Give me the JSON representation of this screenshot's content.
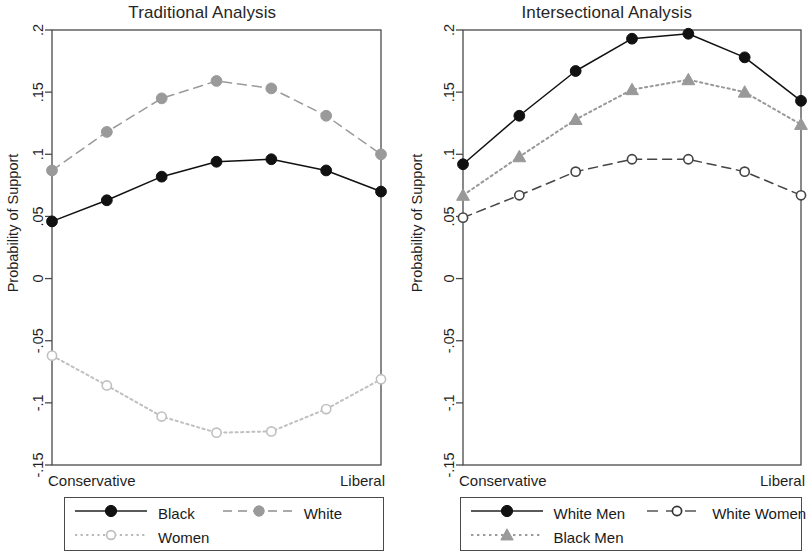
{
  "figure": {
    "background": "#ffffff",
    "axis_color": "#4a4a4a",
    "text_color": "#1f1f1f"
  },
  "panels": [
    {
      "id": "traditional",
      "title": "Traditional Analysis",
      "ylabel": "Probability of Support",
      "x_left_label": "Conservative",
      "x_right_label": "Liberal",
      "legend": [
        {
          "label": "Black",
          "key": "solid-filled-black-circle"
        },
        {
          "label": "White",
          "key": "dashed-filled-gray-circle"
        },
        {
          "label": "Women",
          "key": "dotted-open-lightgray-circle"
        }
      ]
    },
    {
      "id": "intersectional",
      "title": "Intersectional Analysis",
      "ylabel": "Probability of Support",
      "x_left_label": "Conservative",
      "x_right_label": "Liberal",
      "legend": [
        {
          "label": "White Men",
          "key": "solid-filled-black-circle"
        },
        {
          "label": "White Women",
          "key": "dashed-open-circle"
        },
        {
          "label": "Black Men",
          "key": "dotted-gray-triangle"
        }
      ]
    }
  ],
  "chart_data": [
    {
      "type": "line",
      "title": "Traditional Analysis",
      "xlabel": "",
      "ylabel": "Probability of Support",
      "x": [
        1,
        2,
        3,
        4,
        5,
        6,
        7
      ],
      "categories": [
        "Conservative",
        "",
        "",
        "",
        "",
        "",
        "Liberal"
      ],
      "xtick_labels": [
        "Conservative",
        "Liberal"
      ],
      "ylim": [
        -0.15,
        0.2
      ],
      "ytick_labels": [
        ".2",
        ".15",
        ".1",
        ".05",
        "0",
        "-.05",
        "-.1",
        "-.15"
      ],
      "ytick_values": [
        0.2,
        0.15,
        0.1,
        0.05,
        0,
        -0.05,
        -0.1,
        -0.15
      ],
      "grid": false,
      "legend_position": "below",
      "series": [
        {
          "name": "Black",
          "color": "#111111",
          "marker": "circle-filled",
          "linestyle": "solid",
          "values": [
            0.046,
            0.063,
            0.082,
            0.094,
            0.096,
            0.087,
            0.07
          ]
        },
        {
          "name": "White",
          "color": "#9a9a9a",
          "marker": "circle-filled",
          "linestyle": "dashed",
          "values": [
            0.087,
            0.118,
            0.145,
            0.159,
            0.153,
            0.131,
            0.1
          ]
        },
        {
          "name": "Women",
          "color": "#c0c0c0",
          "marker": "circle-open",
          "linestyle": "dotted",
          "values": [
            -0.062,
            -0.086,
            -0.111,
            -0.124,
            -0.123,
            -0.105,
            -0.081
          ]
        }
      ]
    },
    {
      "type": "line",
      "title": "Intersectional Analysis",
      "xlabel": "",
      "ylabel": "Probability of Support",
      "x": [
        1,
        2,
        3,
        4,
        5,
        6,
        7
      ],
      "categories": [
        "Conservative",
        "",
        "",
        "",
        "",
        "",
        "Liberal"
      ],
      "xtick_labels": [
        "Conservative",
        "Liberal"
      ],
      "ylim": [
        -0.15,
        0.2
      ],
      "ytick_labels": [
        ".2",
        ".15",
        ".1",
        ".05",
        "0",
        "-.05",
        "-.1",
        "-.15"
      ],
      "ytick_values": [
        0.2,
        0.15,
        0.1,
        0.05,
        0,
        -0.05,
        -0.1,
        -0.15
      ],
      "grid": false,
      "legend_position": "below",
      "series": [
        {
          "name": "White Men",
          "color": "#111111",
          "marker": "circle-filled",
          "linestyle": "solid",
          "values": [
            0.092,
            0.131,
            0.167,
            0.193,
            0.197,
            0.178,
            0.143
          ]
        },
        {
          "name": "Black Men",
          "color": "#999999",
          "marker": "triangle-filled",
          "linestyle": "dotted",
          "values": [
            0.067,
            0.098,
            0.128,
            0.152,
            0.16,
            0.15,
            0.124
          ]
        },
        {
          "name": "White Women",
          "color": "#444444",
          "marker": "circle-open",
          "linestyle": "dashed",
          "values": [
            0.049,
            0.067,
            0.086,
            0.096,
            0.096,
            0.086,
            0.067
          ]
        }
      ]
    }
  ]
}
